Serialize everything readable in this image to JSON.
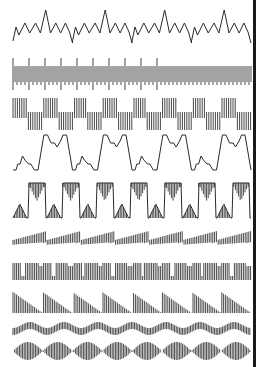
{
  "figure": {
    "colors": {
      "background": "#ffffff",
      "ink": "#2a2a2a",
      "edge_bar": "#1a1a1a"
    },
    "x_start": 13,
    "x_end": 251,
    "rows": [
      {
        "id": "zigzag-spikes",
        "type": "zigzag",
        "y_top": 10,
        "y_bottom": 48,
        "periods": 4
      },
      {
        "id": "dense-pulse-train",
        "type": "dense-spikes",
        "y_top": 58,
        "y_bottom": 90,
        "periods": 15
      },
      {
        "id": "stepped-square-hatch",
        "type": "square-hatch",
        "y_top": 98,
        "y_bottom": 130,
        "periods": 8
      },
      {
        "id": "trapezoid-steps",
        "type": "trapezoid",
        "y_top": 135,
        "y_bottom": 170,
        "periods": 4
      },
      {
        "id": "trapezoid-hatched",
        "type": "trapezoid-hatch",
        "y_top": 183,
        "y_bottom": 218,
        "periods": 7
      },
      {
        "id": "sawtooth-hatched",
        "type": "saw-center",
        "y_top": 230,
        "y_bottom": 252,
        "periods": 7
      },
      {
        "id": "notched-dense",
        "type": "notched",
        "y_top": 263,
        "y_bottom": 280,
        "periods": 8
      },
      {
        "id": "descending-ramp",
        "type": "ramp-down",
        "y_top": 292,
        "y_bottom": 313,
        "periods": 8
      },
      {
        "id": "wavy-band",
        "type": "wavy",
        "y_top": 322,
        "y_bottom": 335,
        "periods": 7
      },
      {
        "id": "beat-envelope",
        "type": "beat",
        "y_top": 342,
        "y_bottom": 360,
        "periods": 8
      }
    ]
  }
}
